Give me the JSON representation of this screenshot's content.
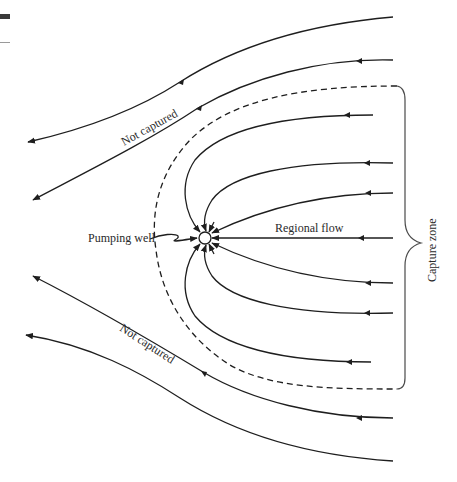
{
  "diagram": {
    "labels": {
      "pumping_well": "Pumping well",
      "regional_flow": "Regional flow",
      "capture_zone": "Capture zone",
      "not_captured_upper": "Not captured",
      "not_captured_lower": "Not captured"
    },
    "colors": {
      "line": "#1e1e1e",
      "brace": "#4a4a4a",
      "background": "#ffffff"
    },
    "elements": {
      "well": {
        "shape": "circle",
        "cx": 205,
        "cy": 238,
        "r": 6
      },
      "streamlines_captured_count": 7,
      "streamlines_not_captured_count": 4,
      "dividing_streamline_style": "dashed"
    }
  }
}
